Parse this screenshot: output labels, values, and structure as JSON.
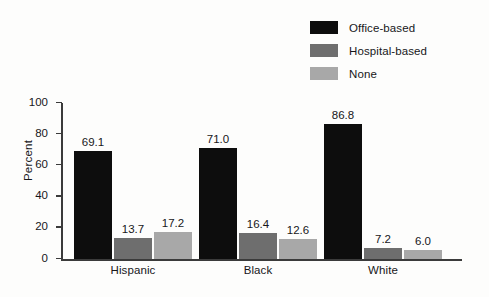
{
  "chart_data": {
    "type": "bar",
    "title": "",
    "xlabel": "",
    "ylabel": "Percent",
    "ylim": [
      0,
      100
    ],
    "yticks": [
      "0",
      "20",
      "40",
      "60",
      "80",
      "100"
    ],
    "grid": false,
    "legend_position": "top-right",
    "categories": [
      "Hispanic",
      "Black",
      "White"
    ],
    "series": [
      {
        "name": "Office-based",
        "color": "#0d0d0d",
        "values": [
          69.1,
          71.0,
          86.8
        ],
        "labels": [
          "69.1",
          "71.0",
          "86.8"
        ]
      },
      {
        "name": "Hospital-based",
        "color": "#6e6e6e",
        "values": [
          13.7,
          16.4,
          7.2
        ],
        "labels": [
          "13.7",
          "16.4",
          "7.2"
        ]
      },
      {
        "name": "None",
        "color": "#a8a8a8",
        "values": [
          17.2,
          12.6,
          6.0
        ],
        "labels": [
          "17.2",
          "12.6",
          "6.0"
        ]
      }
    ]
  }
}
